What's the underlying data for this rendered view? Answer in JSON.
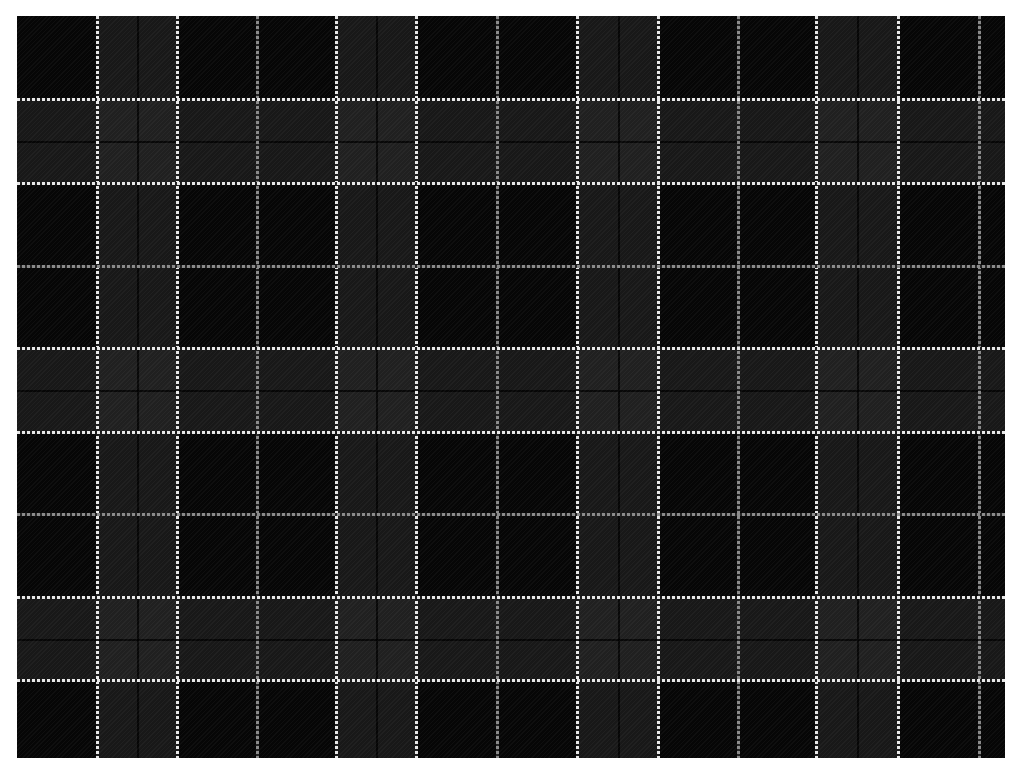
{
  "image": {
    "description": "Black and gray tartan plaid fabric pattern with white and gray dashed stripes",
    "width": 1026,
    "height": 776,
    "background_color": "#ffffff"
  },
  "plaid": {
    "left": 17,
    "top": 16,
    "width": 988,
    "height": 742,
    "base_color": "#060606",
    "band_color": "#1c1c1c",
    "overlap_color": "#2c2c2c",
    "white_stripe_color": "#e8e8e8",
    "gray_stripe_color": "#8a8a8a",
    "vertical_lines": [
      {
        "x": 97,
        "type": "white"
      },
      {
        "x": 177,
        "type": "white"
      },
      {
        "x": 257,
        "type": "gray"
      },
      {
        "x": 336,
        "type": "white"
      },
      {
        "x": 416,
        "type": "white"
      },
      {
        "x": 497,
        "type": "gray"
      },
      {
        "x": 577,
        "type": "white"
      },
      {
        "x": 658,
        "type": "white"
      },
      {
        "x": 738,
        "type": "gray"
      },
      {
        "x": 816,
        "type": "white"
      },
      {
        "x": 898,
        "type": "white"
      },
      {
        "x": 979,
        "type": "gray"
      }
    ],
    "horizontal_lines": [
      {
        "y": 99,
        "type": "white"
      },
      {
        "y": 183,
        "type": "white"
      },
      {
        "y": 266,
        "type": "gray"
      },
      {
        "y": 348,
        "type": "white"
      },
      {
        "y": 432,
        "type": "white"
      },
      {
        "y": 514,
        "type": "gray"
      },
      {
        "y": 597,
        "type": "white"
      },
      {
        "y": 680,
        "type": "white"
      }
    ],
    "vertical_bands": [
      {
        "x1": 97,
        "x2": 177
      },
      {
        "x1": 336,
        "x2": 416
      },
      {
        "x1": 577,
        "x2": 658
      },
      {
        "x1": 816,
        "x2": 898
      }
    ],
    "horizontal_bands": [
      {
        "y1": 99,
        "y2": 183
      },
      {
        "y1": 348,
        "y2": 432
      },
      {
        "y1": 597,
        "y2": 680
      }
    ]
  }
}
